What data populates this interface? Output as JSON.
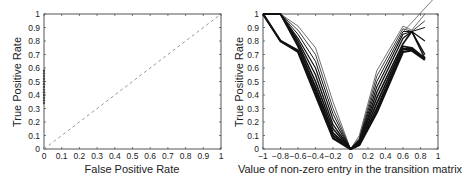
{
  "chart_data": [
    {
      "type": "line",
      "title": "",
      "xlabel": "False Positive Rate",
      "ylabel": "True Positive Rate",
      "xlim": [
        0,
        1
      ],
      "ylim": [
        0,
        1
      ],
      "xticks": [
        "0",
        "0.1",
        "0.2",
        "0.3",
        "0.4",
        "0.5",
        "0.6",
        "0.7",
        "0.8",
        "0.9",
        "1"
      ],
      "yticks": [
        "0",
        "0.1",
        "0.2",
        "0.3",
        "0.4",
        "0.5",
        "0.6",
        "0.7",
        "0.8",
        "0.9",
        "1"
      ],
      "grid": false,
      "series": [
        {
          "name": "diagonal (random)",
          "style": "dashed",
          "x": [
            0,
            1
          ],
          "y": [
            0,
            1
          ]
        },
        {
          "name": "ROC points",
          "style": "markers",
          "x": [
            0,
            0,
            0,
            0,
            0,
            0,
            0,
            0,
            0,
            0,
            0,
            0,
            0
          ],
          "y": [
            0.34,
            0.36,
            0.38,
            0.4,
            0.42,
            0.44,
            0.46,
            0.48,
            0.5,
            0.52,
            0.54,
            0.56,
            0.58
          ]
        }
      ]
    },
    {
      "type": "line",
      "title": "",
      "xlabel": "Value of non-zero entry in the transition matrix",
      "ylabel": "True Positive Rate",
      "xlim": [
        -1,
        1
      ],
      "ylim": [
        0,
        1
      ],
      "xticks": [
        "-1",
        "-0.8",
        "-0.6",
        "-0.4",
        "-0.2",
        "0",
        "0.2",
        "0.4",
        "0.6",
        "0.8",
        "1"
      ],
      "yticks": [
        "0",
        "0.1",
        "0.2",
        "0.3",
        "0.4",
        "0.5",
        "0.6",
        "0.7",
        "0.8",
        "0.9",
        "1"
      ],
      "grid": false,
      "x": [
        -1,
        -0.8,
        -0.6,
        -0.4,
        -0.2,
        0,
        0.1,
        0.3,
        0.6,
        0.7,
        0.85
      ],
      "series": [
        {
          "name": "curve 1 (thin)",
          "values": [
            1.0,
            1.0,
            0.91,
            0.75,
            0.35,
            0.0,
            0.1,
            0.58,
            0.91,
            0.88,
            1.0
          ]
        },
        {
          "name": "curve 2 (thin)",
          "values": [
            1.0,
            1.0,
            0.88,
            0.7,
            0.3,
            0.0,
            0.08,
            0.54,
            0.89,
            0.87,
            0.95
          ]
        },
        {
          "name": "curve 3 (thin)",
          "values": [
            1.0,
            1.0,
            0.85,
            0.65,
            0.26,
            0.0,
            0.07,
            0.5,
            0.87,
            0.87,
            0.9
          ]
        },
        {
          "name": "curve 4 (thin)",
          "values": [
            1.0,
            1.0,
            0.82,
            0.6,
            0.22,
            0.0,
            0.06,
            0.46,
            0.85,
            0.87,
            0.8
          ]
        },
        {
          "name": "curve 5",
          "values": [
            1.0,
            1.0,
            0.8,
            0.55,
            0.18,
            0.0,
            0.05,
            0.42,
            0.82,
            0.87,
            0.7
          ]
        },
        {
          "name": "curve 6",
          "values": [
            1.0,
            1.0,
            0.78,
            0.5,
            0.15,
            0.0,
            0.05,
            0.38,
            0.78,
            0.87,
            0.67
          ]
        },
        {
          "name": "curve 7 (thick)",
          "values": [
            1.0,
            1.0,
            0.76,
            0.46,
            0.12,
            0.0,
            0.04,
            0.34,
            0.76,
            0.75,
            0.67
          ]
        },
        {
          "name": "curve 8 (thick)",
          "values": [
            1.0,
            0.8,
            0.73,
            0.43,
            0.1,
            0.0,
            0.03,
            0.3,
            0.74,
            0.74,
            0.67
          ]
        },
        {
          "name": "curve 9 (thick)",
          "values": [
            1.0,
            0.8,
            0.72,
            0.4,
            0.08,
            0.0,
            0.03,
            0.27,
            0.72,
            0.73,
            0.66
          ]
        }
      ]
    }
  ]
}
